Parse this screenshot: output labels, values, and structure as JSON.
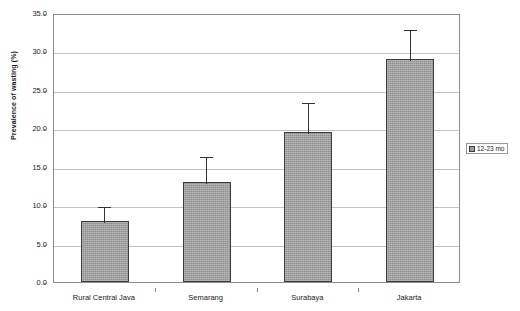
{
  "chart_data": {
    "type": "bar",
    "title": "",
    "xlabel": "",
    "ylabel": "Prevalence of wasting (%)",
    "categories": [
      "Rural Central Java",
      "Semarang",
      "Surabaya",
      "Jakarta"
    ],
    "series": [
      {
        "name": "12-23 mo",
        "values": [
          8.0,
          13.0,
          19.5,
          29.0
        ],
        "error_upper": [
          10.0,
          16.5,
          23.5,
          33.0
        ]
      }
    ],
    "ylim": [
      0.0,
      35.0
    ],
    "ytick_labels": [
      "0.0",
      "5.0",
      "10.0",
      "15.0",
      "20.0",
      "25.0",
      "30.0",
      "35.0"
    ],
    "ytick_values": [
      0.0,
      5.0,
      10.0,
      15.0,
      20.0,
      25.0,
      30.0,
      35.0
    ],
    "grid": true,
    "legend_position": "right",
    "legend_entries": [
      "12-23 mo"
    ],
    "bar_color": "#9d9d9d",
    "bar_border_color": "#3d3d3d",
    "gridline_color": "#c3c3c3",
    "frame_color": "#8d8d8d",
    "errorbar_color": "#333333"
  }
}
